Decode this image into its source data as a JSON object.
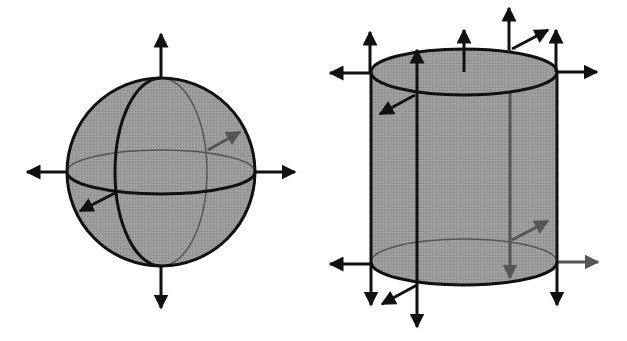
{
  "figure": {
    "colors": {
      "background": "#ffffff",
      "fill": "#9a9a9a",
      "stroke": "#111111",
      "hidden_stroke": "#555555"
    },
    "sphere": {
      "cx": 161,
      "cy": 172,
      "r": 94,
      "equator": {
        "rx": 94,
        "ry": 22
      },
      "meridian": {
        "rx": 46,
        "ry": 94
      },
      "arrows": [
        {
          "name": "up",
          "x1": 161,
          "y1": 78,
          "x2": 161,
          "y2": 34,
          "hidden": false
        },
        {
          "name": "down",
          "x1": 161,
          "y1": 266,
          "x2": 161,
          "y2": 308,
          "hidden": false
        },
        {
          "name": "left",
          "x1": 67,
          "y1": 172,
          "x2": 27,
          "y2": 172,
          "hidden": false
        },
        {
          "name": "right",
          "x1": 255,
          "y1": 172,
          "x2": 295,
          "y2": 172,
          "hidden": false
        },
        {
          "name": "front",
          "x1": 115,
          "y1": 193,
          "x2": 80,
          "y2": 211,
          "hidden": false
        },
        {
          "name": "back",
          "x1": 208,
          "y1": 150,
          "x2": 240,
          "y2": 132,
          "hidden": true
        }
      ]
    },
    "cylinder": {
      "left": 371,
      "right": 557,
      "top_cy": 72,
      "bottom_cy": 262,
      "ry": 23,
      "inner_front_x": 417,
      "inner_back_x": 510,
      "arrows": [
        {
          "name": "top-center-up",
          "x1": 464,
          "y1": 72,
          "x2": 464,
          "y2": 30,
          "hidden": false
        },
        {
          "name": "top-left-up",
          "x1": 370,
          "y1": 72,
          "x2": 370,
          "y2": 32,
          "hidden": false
        },
        {
          "name": "top-right-up",
          "x1": 556,
          "y1": 72,
          "x2": 556,
          "y2": 30,
          "hidden": false
        },
        {
          "name": "top-back-up",
          "x1": 509,
          "y1": 50,
          "x2": 509,
          "y2": 8,
          "hidden": false
        },
        {
          "name": "top-left-out",
          "x1": 370,
          "y1": 73,
          "x2": 330,
          "y2": 73,
          "hidden": false
        },
        {
          "name": "top-right-out",
          "x1": 557,
          "y1": 72,
          "x2": 597,
          "y2": 72,
          "hidden": false
        },
        {
          "name": "top-back-diag",
          "x1": 512,
          "y1": 49,
          "x2": 548,
          "y2": 30,
          "hidden": false
        },
        {
          "name": "top-front-diag",
          "x1": 415,
          "y1": 95,
          "x2": 380,
          "y2": 114,
          "hidden": false
        },
        {
          "name": "front-line-up",
          "x1": 417,
          "y1": 285,
          "x2": 417,
          "y2": 50,
          "hidden": false
        },
        {
          "name": "front-line-down",
          "x1": 417,
          "y1": 285,
          "x2": 417,
          "y2": 327,
          "hidden": false
        },
        {
          "name": "bottom-left-out",
          "x1": 371,
          "y1": 264,
          "x2": 330,
          "y2": 264,
          "hidden": false
        },
        {
          "name": "bottom-right-out",
          "x1": 557,
          "y1": 262,
          "x2": 598,
          "y2": 262,
          "hidden": true
        },
        {
          "name": "bottom-left-down",
          "x1": 371,
          "y1": 262,
          "x2": 371,
          "y2": 305,
          "hidden": false
        },
        {
          "name": "bottom-right-down",
          "x1": 557,
          "y1": 262,
          "x2": 557,
          "y2": 305,
          "hidden": false
        },
        {
          "name": "bottom-front-diag",
          "x1": 417,
          "y1": 285,
          "x2": 382,
          "y2": 304,
          "hidden": false
        },
        {
          "name": "bottom-back-diag",
          "x1": 512,
          "y1": 240,
          "x2": 548,
          "y2": 221,
          "hidden": true
        },
        {
          "name": "back-line-down",
          "x1": 510,
          "y1": 50,
          "x2": 510,
          "y2": 278,
          "hidden": true
        }
      ]
    }
  }
}
